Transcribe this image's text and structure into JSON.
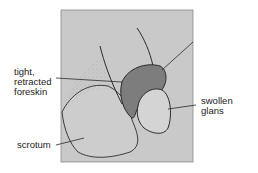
{
  "figure": {
    "panel_background": "#c9c9c9",
    "foreskin_color": "#7d7d7d",
    "line_color": "#2a2a2a",
    "labels": {
      "foreskin": [
        "tight,",
        "retracted",
        "foreskin"
      ],
      "glans": [
        "swollen",
        "glans"
      ],
      "scrotum": "scrotum"
    }
  }
}
